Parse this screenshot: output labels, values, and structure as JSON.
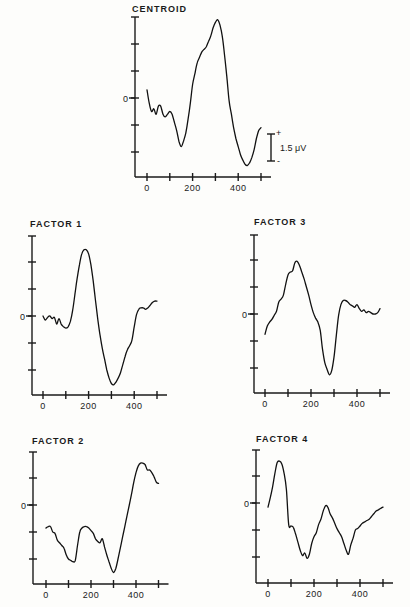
{
  "chart_data": [
    {
      "type": "line",
      "id": "centroid",
      "title": "CENTROID",
      "xlabel": "",
      "ylabel": "",
      "x_ticks": [
        0,
        100,
        200,
        300,
        400,
        500
      ],
      "x_tick_labels": [
        "0",
        "200",
        "400"
      ],
      "x_tick_label_values": [
        0,
        200,
        400
      ],
      "y_zero_label": "0",
      "xlim": [
        0,
        500
      ],
      "ylim": [
        -3,
        3
      ],
      "y_ticks": [
        -2,
        -1,
        0,
        1,
        2,
        3
      ],
      "scale_bar": {
        "label": "1.5 μV",
        "plus": "+",
        "minus": "-",
        "units_span": 1
      },
      "x": [
        0,
        10,
        20,
        30,
        40,
        50,
        60,
        70,
        80,
        90,
        100,
        110,
        120,
        130,
        140,
        150,
        160,
        170,
        180,
        190,
        200,
        210,
        220,
        230,
        240,
        250,
        260,
        270,
        280,
        290,
        300,
        310,
        320,
        330,
        340,
        350,
        360,
        370,
        380,
        390,
        400,
        410,
        420,
        430,
        440,
        450,
        460,
        470,
        480,
        490,
        500
      ],
      "y": [
        0.3,
        -0.2,
        -0.5,
        -0.4,
        -0.6,
        -0.3,
        -0.3,
        -0.6,
        -0.7,
        -0.6,
        -0.5,
        -0.6,
        -0.9,
        -1.2,
        -1.6,
        -1.8,
        -1.6,
        -1.3,
        -0.8,
        -0.2,
        0.5,
        0.9,
        1.3,
        1.5,
        1.7,
        1.8,
        1.9,
        2.1,
        2.3,
        2.6,
        2.8,
        2.9,
        2.7,
        2.3,
        1.6,
        0.8,
        -0.1,
        -0.6,
        -1.1,
        -1.5,
        -1.8,
        -2.1,
        -2.3,
        -2.45,
        -2.5,
        -2.4,
        -2.2,
        -1.9,
        -1.5,
        -1.2,
        -1.1
      ]
    },
    {
      "type": "line",
      "id": "factor1",
      "title": "FACTOR 1",
      "x_ticks": [
        0,
        100,
        200,
        300,
        400,
        500
      ],
      "x_tick_labels": [
        "0",
        "200",
        "400"
      ],
      "x_tick_label_values": [
        0,
        200,
        400
      ],
      "y_zero_label": "0",
      "xlim": [
        0,
        500
      ],
      "ylim": [
        -3,
        3
      ],
      "y_ticks": [
        -2,
        -1,
        0,
        1,
        2,
        3
      ],
      "x": [
        0,
        10,
        20,
        30,
        40,
        50,
        60,
        70,
        80,
        90,
        100,
        110,
        120,
        130,
        140,
        150,
        160,
        170,
        180,
        190,
        200,
        210,
        220,
        230,
        240,
        250,
        260,
        270,
        280,
        290,
        300,
        310,
        320,
        330,
        340,
        350,
        360,
        370,
        380,
        390,
        400,
        410,
        420,
        430,
        440,
        450,
        460,
        470,
        480,
        490,
        500
      ],
      "y": [
        0.0,
        -0.15,
        -0.05,
        0.0,
        -0.1,
        -0.05,
        -0.3,
        -0.1,
        -0.3,
        -0.4,
        -0.45,
        -0.4,
        -0.2,
        0.2,
        0.8,
        1.4,
        1.9,
        2.3,
        2.45,
        2.45,
        2.3,
        1.9,
        1.3,
        0.6,
        -0.1,
        -0.7,
        -1.2,
        -1.6,
        -2.0,
        -2.3,
        -2.5,
        -2.55,
        -2.45,
        -2.3,
        -2.1,
        -1.8,
        -1.5,
        -1.25,
        -1.1,
        -0.9,
        -0.4,
        0.05,
        0.25,
        0.3,
        0.3,
        0.25,
        0.3,
        0.4,
        0.5,
        0.55,
        0.55
      ]
    },
    {
      "type": "line",
      "id": "factor3",
      "title": "FACTOR 3",
      "x_ticks": [
        0,
        100,
        200,
        300,
        400,
        500
      ],
      "x_tick_labels": [
        "0",
        "200",
        "400"
      ],
      "x_tick_label_values": [
        0,
        200,
        400
      ],
      "y_zero_label": "0",
      "xlim": [
        0,
        500
      ],
      "ylim": [
        -3,
        3
      ],
      "y_ticks": [
        -2,
        -1,
        0,
        1,
        2,
        3
      ],
      "x": [
        0,
        10,
        20,
        30,
        40,
        50,
        60,
        70,
        80,
        90,
        100,
        110,
        120,
        130,
        140,
        150,
        160,
        170,
        180,
        190,
        200,
        210,
        220,
        230,
        240,
        250,
        260,
        270,
        280,
        290,
        300,
        310,
        320,
        330,
        340,
        350,
        360,
        370,
        380,
        390,
        400,
        410,
        420,
        430,
        440,
        450,
        460,
        470,
        480,
        490,
        500
      ],
      "y": [
        -0.75,
        -0.45,
        -0.3,
        -0.2,
        -0.05,
        0.1,
        0.45,
        0.55,
        0.7,
        1.1,
        1.45,
        1.55,
        1.6,
        1.9,
        1.95,
        1.8,
        1.55,
        1.3,
        1.0,
        0.7,
        0.35,
        0.05,
        -0.15,
        -0.3,
        -0.6,
        -1.3,
        -1.8,
        -2.05,
        -2.25,
        -2.1,
        -1.6,
        -0.8,
        -0.05,
        0.35,
        0.5,
        0.5,
        0.45,
        0.35,
        0.3,
        0.25,
        0.35,
        0.2,
        0.1,
        0.15,
        0.05,
        0.1,
        0.05,
        0.0,
        0.0,
        0.05,
        0.2
      ]
    },
    {
      "type": "line",
      "id": "factor2",
      "title": "FACTOR 2",
      "x_ticks": [
        0,
        100,
        200,
        300,
        400,
        500
      ],
      "x_tick_labels": [
        "0",
        "200",
        "400"
      ],
      "x_tick_label_values": [
        0,
        200,
        400
      ],
      "y_zero_label": "0",
      "xlim": [
        0,
        500
      ],
      "ylim": [
        -3,
        2
      ],
      "y_ticks": [
        -2,
        -1,
        0,
        1,
        2
      ],
      "x": [
        0,
        10,
        20,
        30,
        40,
        50,
        60,
        70,
        80,
        90,
        100,
        110,
        120,
        130,
        140,
        150,
        160,
        170,
        180,
        190,
        200,
        210,
        220,
        230,
        240,
        250,
        260,
        270,
        280,
        290,
        300,
        310,
        320,
        330,
        340,
        350,
        360,
        370,
        380,
        390,
        400,
        410,
        420,
        430,
        440,
        450,
        460,
        470,
        480,
        490,
        500
      ],
      "y": [
        -0.85,
        -0.8,
        -0.8,
        -1.0,
        -1.05,
        -1.3,
        -1.4,
        -1.5,
        -1.6,
        -1.85,
        -2.0,
        -2.05,
        -2.1,
        -2.05,
        -1.5,
        -1.0,
        -0.85,
        -0.8,
        -0.8,
        -0.85,
        -0.95,
        -1.05,
        -1.25,
        -1.35,
        -1.4,
        -1.25,
        -1.55,
        -1.85,
        -2.1,
        -2.35,
        -2.5,
        -2.35,
        -2.0,
        -1.6,
        -1.2,
        -0.8,
        -0.4,
        0.0,
        0.4,
        0.85,
        1.2,
        1.45,
        1.55,
        1.55,
        1.5,
        1.3,
        1.3,
        1.2,
        1.05,
        0.85,
        0.8
      ]
    },
    {
      "type": "line",
      "id": "factor4",
      "title": "FACTOR 4",
      "x_ticks": [
        0,
        100,
        200,
        300,
        400,
        500
      ],
      "x_tick_labels": [
        "0",
        "200",
        "400"
      ],
      "x_tick_label_values": [
        0,
        200,
        400
      ],
      "y_zero_label": "0",
      "xlim": [
        0,
        500
      ],
      "ylim": [
        -3,
        2
      ],
      "y_ticks": [
        -2,
        -1,
        0,
        1,
        2
      ],
      "x": [
        0,
        10,
        20,
        30,
        40,
        50,
        60,
        70,
        80,
        90,
        100,
        110,
        120,
        130,
        140,
        150,
        160,
        170,
        180,
        190,
        200,
        210,
        220,
        230,
        240,
        250,
        260,
        270,
        280,
        290,
        300,
        310,
        320,
        330,
        340,
        350,
        360,
        370,
        380,
        390,
        400,
        410,
        420,
        430,
        440,
        450,
        460,
        470,
        480,
        490,
        500
      ],
      "y": [
        -0.15,
        0.2,
        0.6,
        1.1,
        1.5,
        1.55,
        1.45,
        1.1,
        0.5,
        -0.8,
        -0.85,
        -0.9,
        -1.15,
        -1.45,
        -1.75,
        -1.95,
        -1.85,
        -2.05,
        -1.9,
        -1.5,
        -1.25,
        -1.1,
        -0.8,
        -0.6,
        -0.3,
        -0.1,
        -0.15,
        -0.4,
        -0.55,
        -0.75,
        -0.95,
        -1.1,
        -1.25,
        -1.5,
        -1.75,
        -1.9,
        -1.55,
        -1.3,
        -1.0,
        -0.95,
        -0.85,
        -0.75,
        -0.7,
        -0.65,
        -0.6,
        -0.5,
        -0.4,
        -0.3,
        -0.25,
        -0.2,
        -0.15
      ]
    }
  ]
}
